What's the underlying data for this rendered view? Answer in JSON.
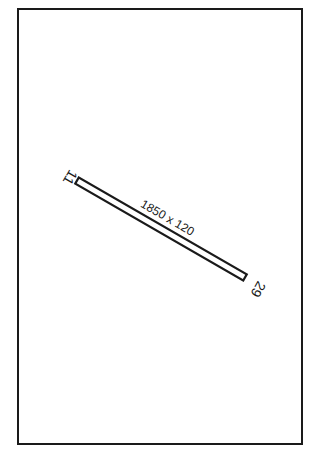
{
  "diagram": {
    "type": "airport-runway-diagram",
    "runway": {
      "dimensions_label": "1850 x 120",
      "end_a_label": "11",
      "end_b_label": "29"
    },
    "colors": {
      "line": "#1a1a1a",
      "background": "#ffffff"
    }
  }
}
